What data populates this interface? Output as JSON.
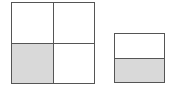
{
  "diagram": {
    "colors": {
      "stroke": "#555555",
      "shaded": "#d9d9d9",
      "unshaded": "#ffffff",
      "background": "#ffffff"
    },
    "shapes": [
      {
        "name": "square-quarters",
        "x": 11,
        "y": 2,
        "width": 84,
        "height": 82,
        "rows": 2,
        "cols": 2,
        "cells": [
          {
            "row": 0,
            "col": 0,
            "shaded": false
          },
          {
            "row": 0,
            "col": 1,
            "shaded": false
          },
          {
            "row": 1,
            "col": 0,
            "shaded": true
          },
          {
            "row": 1,
            "col": 1,
            "shaded": false
          }
        ]
      },
      {
        "name": "rectangle-halves",
        "x": 114,
        "y": 33,
        "width": 51,
        "height": 50,
        "rows": 2,
        "cols": 1,
        "cells": [
          {
            "row": 0,
            "col": 0,
            "shaded": false
          },
          {
            "row": 1,
            "col": 0,
            "shaded": true
          }
        ]
      }
    ]
  }
}
